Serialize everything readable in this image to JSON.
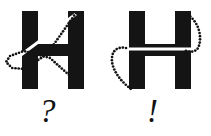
{
  "figure": {
    "background_color": "#ffffff",
    "ink_color": "#141414",
    "erase_color": "#ffffff",
    "dot_color": "#141414",
    "panels": [
      {
        "id": "left-panel",
        "letter": "H",
        "verdict_symbol": "?",
        "verdict_name": "question-mark",
        "path_kind": "crossed-loop",
        "description": "letter H with a dotted stroke path that loops out to the left and crosses itself diagonally",
        "letter_box": {
          "x": 22,
          "y": 11,
          "width": 62,
          "height": 78
        },
        "stem_width": 16,
        "crossbar": {
          "y": 44,
          "height": 12
        },
        "erase_stroke": {
          "kind": "line",
          "x1": 6,
          "y1": 66,
          "x2": 76,
          "y2": 14,
          "width": 3
        },
        "dotted_paths": [
          {
            "name": "loop-outbound",
            "d": "M 76 13 L 47 54 L 25 69 L 12 68 L 6 62 L 10 56 L 24 51 L 50 58 L 78 83"
          }
        ],
        "dot_radius": 1.35,
        "dot_spacing": 3.2
      },
      {
        "id": "right-panel",
        "letter": "H",
        "verdict_symbol": "!",
        "verdict_name": "exclamation-mark",
        "path_kind": "smooth-arcs",
        "description": "letter H with a smooth dotted stroke path arcing down the right side and around the left side without crossing",
        "letter_box": {
          "x": 129,
          "y": 11,
          "width": 62,
          "height": 78
        },
        "stem_width": 16,
        "crossbar": {
          "y": 44,
          "height": 12
        },
        "erase_stroke": {
          "kind": "line",
          "x1": 117,
          "y1": 49,
          "x2": 196,
          "y2": 49,
          "width": 3
        },
        "dotted_paths": [
          {
            "name": "right-arc",
            "d": "M 185 13 C 199 20 203 38 198 48 C 195 53 188 52 184 50"
          },
          {
            "name": "left-arc",
            "d": "M 126 48 C 116 46 111 52 112 62 C 114 74 124 84 131 89"
          }
        ],
        "dot_radius": 1.35,
        "dot_spacing": 3.2
      }
    ]
  },
  "labels": {
    "question": "?",
    "exclamation": "!"
  }
}
